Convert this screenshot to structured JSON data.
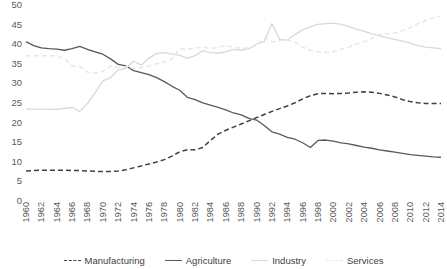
{
  "chart_data": {
    "type": "line",
    "title": "",
    "xlabel": "",
    "ylabel": "",
    "ylim": [
      0,
      50
    ],
    "ytick_step": 5,
    "yticks": [
      0,
      5,
      10,
      15,
      20,
      25,
      30,
      35,
      40,
      45,
      50
    ],
    "grid": false,
    "legend_position": "bottom",
    "xlim": [
      1960,
      2014
    ],
    "x": [
      1960,
      1961,
      1962,
      1963,
      1964,
      1965,
      1966,
      1967,
      1968,
      1969,
      1970,
      1971,
      1972,
      1973,
      1974,
      1975,
      1976,
      1977,
      1978,
      1979,
      1980,
      1981,
      1982,
      1983,
      1984,
      1985,
      1986,
      1987,
      1988,
      1989,
      1990,
      1991,
      1992,
      1993,
      1994,
      1995,
      1996,
      1997,
      1998,
      1999,
      2000,
      2001,
      2002,
      2003,
      2004,
      2005,
      2006,
      2007,
      2008,
      2009,
      2010,
      2011,
      2012,
      2013,
      2014
    ],
    "xtick_labels": [
      "1960",
      "1962",
      "1964",
      "1966",
      "1968",
      "1970",
      "1972",
      "1974",
      "1976",
      "1978",
      "1980",
      "1982",
      "1984",
      "1986",
      "1988",
      "1990",
      "1992",
      "1994",
      "1996",
      "1998",
      "2000",
      "2002",
      "2004",
      "2006",
      "2008",
      "2010",
      "2012",
      "2014"
    ],
    "series": [
      {
        "name": "Manufacturing",
        "color": "#404040",
        "style": "dashed",
        "values": [
          7.4,
          7.5,
          7.6,
          7.6,
          7.6,
          7.6,
          7.5,
          7.5,
          7.4,
          7.3,
          7.3,
          7.3,
          7.4,
          7.7,
          8.2,
          8.7,
          9.2,
          9.7,
          10.3,
          11.2,
          12.3,
          12.8,
          12.8,
          13.4,
          15.2,
          16.8,
          17.8,
          18.6,
          19.4,
          20.2,
          21.0,
          21.8,
          22.6,
          23.3,
          24.0,
          24.8,
          25.8,
          26.6,
          27.1,
          27.2,
          27.1,
          27.2,
          27.3,
          27.5,
          27.6,
          27.5,
          27.2,
          26.8,
          26.3,
          25.6,
          25.1,
          24.8,
          24.6,
          24.6,
          24.6
        ]
      },
      {
        "name": "Agriculture",
        "color": "#595959",
        "style": "solid",
        "values": [
          40.4,
          39.4,
          38.8,
          38.6,
          38.5,
          38.2,
          38.6,
          39.2,
          38.4,
          37.8,
          37.2,
          36.0,
          34.6,
          34.2,
          33.0,
          32.5,
          32.0,
          31.2,
          30.2,
          29.0,
          28.0,
          26.2,
          25.6,
          24.8,
          24.2,
          23.6,
          23.0,
          22.2,
          21.7,
          20.8,
          20.4,
          19.0,
          17.4,
          16.8,
          16.0,
          15.5,
          14.6,
          13.4,
          15.2,
          15.3,
          15.0,
          14.6,
          14.3,
          13.9,
          13.5,
          13.2,
          12.8,
          12.5,
          12.2,
          11.9,
          11.6,
          11.4,
          11.2,
          11.0,
          10.9
        ]
      },
      {
        "name": "Industry",
        "color": "#d9d9d9",
        "style": "solid",
        "values": [
          23.2,
          23.2,
          23.2,
          23.1,
          23.1,
          23.4,
          23.6,
          22.6,
          24.6,
          27.4,
          30.4,
          31.2,
          33.2,
          33.6,
          35.4,
          34.4,
          36.2,
          37.4,
          37.6,
          37.2,
          36.9,
          36.2,
          36.8,
          38.1,
          37.6,
          37.5,
          37.8,
          38.4,
          38.2,
          38.6,
          39.8,
          40.4,
          45.0,
          41.0,
          40.8,
          42.2,
          43.4,
          44.2,
          44.8,
          45.0,
          45.1,
          44.8,
          44.2,
          43.6,
          43.0,
          42.4,
          41.9,
          41.4,
          41.0,
          40.5,
          40.0,
          39.4,
          39.0,
          38.8,
          38.6
        ]
      },
      {
        "name": "Services",
        "color": "#e8e8e8",
        "style": "dashed",
        "values": [
          36.8,
          36.8,
          36.8,
          36.8,
          36.8,
          36.0,
          34.2,
          34.0,
          32.6,
          32.4,
          32.8,
          34.2,
          33.8,
          34.0,
          33.6,
          33.8,
          34.2,
          34.8,
          35.2,
          36.0,
          38.6,
          38.4,
          38.8,
          39.0,
          38.6,
          38.9,
          39.4,
          39.0,
          38.7,
          38.8,
          39.4,
          41.4,
          40.4,
          40.6,
          40.8,
          40.2,
          39.0,
          38.2,
          37.8,
          37.6,
          37.8,
          38.4,
          39.0,
          39.8,
          40.4,
          41.2,
          42.2,
          42.4,
          42.6,
          43.2,
          44.0,
          45.0,
          45.8,
          46.4,
          47.0
        ]
      }
    ]
  }
}
